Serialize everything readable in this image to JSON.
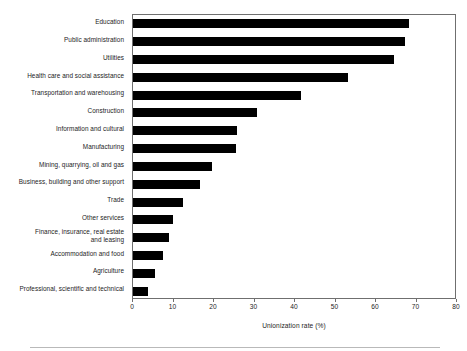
{
  "chart_data": {
    "type": "bar",
    "orientation": "horizontal",
    "title": "",
    "subtitle": "",
    "xlabel": "Unionization rate (%)",
    "ylabel": "",
    "xlim": [
      0,
      80
    ],
    "xticks": [
      0,
      10,
      20,
      30,
      40,
      50,
      60,
      70,
      80
    ],
    "xtick_labels": [
      "0",
      "10",
      "20",
      "30",
      "40",
      "50",
      "60",
      "70",
      "80"
    ],
    "grid": false,
    "legend": null,
    "bar_color": "#000000",
    "frame_color": "#6f6f6f",
    "categories": [
      "Education",
      "Public administration",
      "Utilities",
      "Health care and social assistance",
      "Transportation and warehousing",
      "Construction",
      "Information and cultural",
      "Manufacturing",
      "Mining, quarrying, oil and gas",
      "Business, building and other support",
      "Trade",
      "Other services",
      "Finance, insurance, real estate\nand leasing",
      "Accommodation and food",
      "Agriculture",
      "Professional, scientific and technical"
    ],
    "values": [
      68.1,
      67.2,
      64.4,
      53.1,
      41.5,
      30.6,
      25.7,
      25.4,
      19.5,
      16.5,
      12.3,
      9.9,
      8.9,
      7.4,
      5.4,
      3.7
    ]
  }
}
